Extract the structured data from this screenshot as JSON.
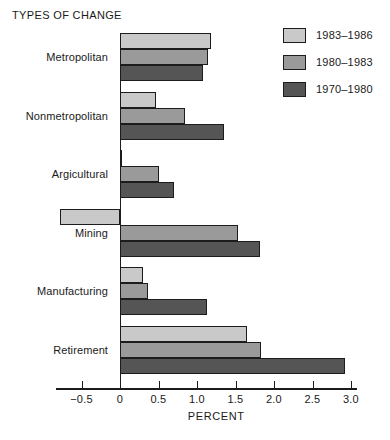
{
  "chart_data": {
    "type": "bar",
    "orientation": "horizontal",
    "title": "TYPES OF CHANGE",
    "xlabel": "PERCENT",
    "ylabel": "",
    "xlim": [
      -0.75,
      3.0
    ],
    "xticks": [
      -0.5,
      0,
      0.5,
      1.0,
      1.5,
      2.0,
      2.5,
      3.0
    ],
    "xticklabels": [
      "−0.5",
      "0",
      "0.5",
      "1.0",
      "1.5",
      "2.0",
      "2.5",
      "3.0"
    ],
    "grid": false,
    "legend_position": "top-right",
    "categories": [
      "Metropolitan",
      "Nonmetropolitan",
      "Argicultural",
      "Mining",
      "Manufacturing",
      "Retirement"
    ],
    "series": [
      {
        "name": "1983–1986",
        "color": "#c9c9c9",
        "values": [
          1.18,
          0.47,
          0.0,
          -0.78,
          0.3,
          1.65
        ]
      },
      {
        "name": "1980–1983",
        "color": "#9a9a9a",
        "values": [
          1.14,
          0.84,
          0.5,
          1.53,
          0.36,
          1.83
        ]
      },
      {
        "name": "1970–1980",
        "color": "#555555",
        "values": [
          1.08,
          1.35,
          0.7,
          1.82,
          1.13,
          2.92
        ]
      }
    ]
  },
  "colors": {
    "series_light": "#c9c9c9",
    "series_medium": "#9a9a9a",
    "series_dark": "#555555",
    "outline": "#1c1c1c",
    "background": "#ffffff",
    "text": "#1a1a1a"
  }
}
